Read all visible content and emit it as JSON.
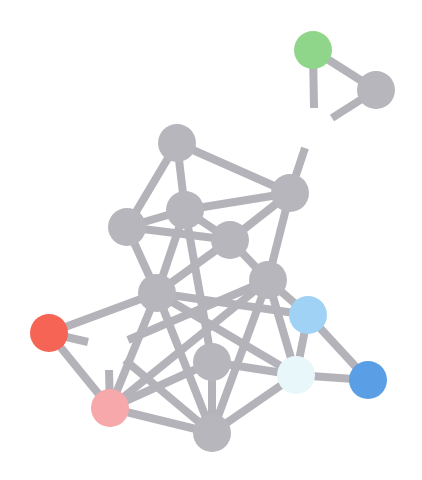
{
  "diagram": {
    "type": "network-graph",
    "background": "#ffffff",
    "edge_color": "#b5b3ba",
    "node_radius": 19,
    "nodes": [
      {
        "id": "n1",
        "x": 313,
        "y": 50,
        "color": "#8fd68a"
      },
      {
        "id": "n2",
        "x": 376,
        "y": 90,
        "color": "#b8b6bd"
      },
      {
        "id": "n3",
        "x": 177,
        "y": 143,
        "color": "#b8b6bd"
      },
      {
        "id": "n4",
        "x": 290,
        "y": 193,
        "color": "#b8b6bd"
      },
      {
        "id": "n5",
        "x": 185,
        "y": 210,
        "color": "#b8b6bd"
      },
      {
        "id": "n6",
        "x": 127,
        "y": 227,
        "color": "#b8b6bd"
      },
      {
        "id": "n7",
        "x": 230,
        "y": 240,
        "color": "#b8b6bd"
      },
      {
        "id": "n8",
        "x": 268,
        "y": 280,
        "color": "#b8b6bd"
      },
      {
        "id": "n9",
        "x": 157,
        "y": 293,
        "color": "#b8b6bd"
      },
      {
        "id": "n10",
        "x": 308,
        "y": 315,
        "color": "#9fd2f4"
      },
      {
        "id": "n11",
        "x": 49,
        "y": 333,
        "color": "#f56455"
      },
      {
        "id": "n12",
        "x": 212,
        "y": 362,
        "color": "#b8b6bd"
      },
      {
        "id": "n13",
        "x": 296,
        "y": 375,
        "color": "#e8f8fa"
      },
      {
        "id": "n14",
        "x": 368,
        "y": 380,
        "color": "#5a9ee6"
      },
      {
        "id": "n15",
        "x": 110,
        "y": 408,
        "color": "#f6a8aa"
      },
      {
        "id": "n16",
        "x": 212,
        "y": 433,
        "color": "#b8b6bd"
      }
    ],
    "edges": [
      {
        "x1": 313,
        "y1": 50,
        "x2": 376,
        "y2": 90
      },
      {
        "x1": 313,
        "y1": 50,
        "x2": 314,
        "y2": 108
      },
      {
        "x1": 376,
        "y1": 90,
        "x2": 332,
        "y2": 118
      },
      {
        "x1": 290,
        "y1": 193,
        "x2": 305,
        "y2": 148
      },
      {
        "x1": 177,
        "y1": 143,
        "x2": 290,
        "y2": 193
      },
      {
        "x1": 177,
        "y1": 143,
        "x2": 185,
        "y2": 210
      },
      {
        "x1": 177,
        "y1": 143,
        "x2": 127,
        "y2": 227
      },
      {
        "x1": 185,
        "y1": 210,
        "x2": 290,
        "y2": 193
      },
      {
        "x1": 185,
        "y1": 210,
        "x2": 127,
        "y2": 227
      },
      {
        "x1": 185,
        "y1": 210,
        "x2": 230,
        "y2": 240
      },
      {
        "x1": 185,
        "y1": 210,
        "x2": 157,
        "y2": 293
      },
      {
        "x1": 185,
        "y1": 210,
        "x2": 212,
        "y2": 362
      },
      {
        "x1": 127,
        "y1": 227,
        "x2": 230,
        "y2": 240
      },
      {
        "x1": 127,
        "y1": 227,
        "x2": 157,
        "y2": 293
      },
      {
        "x1": 230,
        "y1": 240,
        "x2": 290,
        "y2": 193
      },
      {
        "x1": 230,
        "y1": 240,
        "x2": 268,
        "y2": 280
      },
      {
        "x1": 230,
        "y1": 240,
        "x2": 157,
        "y2": 293
      },
      {
        "x1": 290,
        "y1": 193,
        "x2": 268,
        "y2": 280
      },
      {
        "x1": 268,
        "y1": 280,
        "x2": 308,
        "y2": 315
      },
      {
        "x1": 268,
        "y1": 280,
        "x2": 296,
        "y2": 375
      },
      {
        "x1": 268,
        "y1": 280,
        "x2": 212,
        "y2": 433
      },
      {
        "x1": 268,
        "y1": 280,
        "x2": 128,
        "y2": 340
      },
      {
        "x1": 157,
        "y1": 293,
        "x2": 308,
        "y2": 315
      },
      {
        "x1": 157,
        "y1": 293,
        "x2": 49,
        "y2": 333
      },
      {
        "x1": 157,
        "y1": 293,
        "x2": 110,
        "y2": 408
      },
      {
        "x1": 157,
        "y1": 293,
        "x2": 212,
        "y2": 433
      },
      {
        "x1": 157,
        "y1": 293,
        "x2": 296,
        "y2": 375
      },
      {
        "x1": 49,
        "y1": 333,
        "x2": 88,
        "y2": 342
      },
      {
        "x1": 49,
        "y1": 333,
        "x2": 110,
        "y2": 408
      },
      {
        "x1": 110,
        "y1": 408,
        "x2": 109,
        "y2": 370
      },
      {
        "x1": 110,
        "y1": 408,
        "x2": 268,
        "y2": 280
      },
      {
        "x1": 110,
        "y1": 408,
        "x2": 212,
        "y2": 362
      },
      {
        "x1": 110,
        "y1": 408,
        "x2": 212,
        "y2": 433
      },
      {
        "x1": 125,
        "y1": 360,
        "x2": 212,
        "y2": 433
      },
      {
        "x1": 212,
        "y1": 362,
        "x2": 296,
        "y2": 375
      },
      {
        "x1": 212,
        "y1": 362,
        "x2": 212,
        "y2": 433
      },
      {
        "x1": 308,
        "y1": 315,
        "x2": 296,
        "y2": 375
      },
      {
        "x1": 308,
        "y1": 315,
        "x2": 368,
        "y2": 380
      },
      {
        "x1": 296,
        "y1": 375,
        "x2": 368,
        "y2": 380
      },
      {
        "x1": 296,
        "y1": 375,
        "x2": 212,
        "y2": 433
      }
    ]
  }
}
